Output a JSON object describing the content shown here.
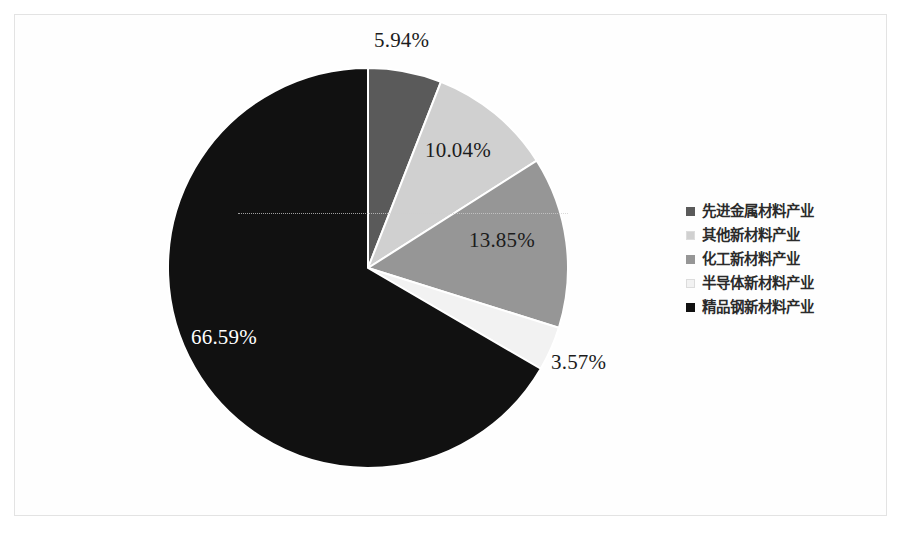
{
  "chart_data": {
    "type": "pie",
    "title": "",
    "subtitle": "",
    "xlabel": "",
    "ylabel": "",
    "grid": false,
    "legend_position": "right",
    "start_angle_deg": 0,
    "direction": "clockwise",
    "categories": [
      "先进金属材料产业",
      "其他新材料产业",
      "化工新材料产业",
      "半导体新材料产业",
      "精品钢新材料产业"
    ],
    "values": [
      5.94,
      10.04,
      13.85,
      3.57,
      66.59
    ],
    "value_labels": [
      "5.94%",
      "10.04%",
      "13.85%",
      "3.57%",
      "66.59%"
    ],
    "slice_colors": [
      "#5a5a5a",
      "#d0d0d0",
      "#969696",
      "#f2f2f2",
      "#111111"
    ],
    "label_text_colors": [
      "#1c1c1c",
      "#1c1c1c",
      "#1c1c1c",
      "#1c1c1c",
      "#ffffff"
    ],
    "units": "percent",
    "total": 99.99
  },
  "figure": {
    "border_color": "#e3e3e3",
    "background": "#ffffff"
  },
  "labels": {
    "slice_0": "5.94%",
    "slice_1": "10.04%",
    "slice_2": "13.85%",
    "slice_3": "3.57%",
    "slice_4": "66.59%"
  },
  "legend": {
    "items": [
      {
        "label": "先进金属材料产业",
        "color": "#5a5a5a"
      },
      {
        "label": "其他新材料产业",
        "color": "#d0d0d0"
      },
      {
        "label": "化工新材料产业",
        "color": "#969696"
      },
      {
        "label": "半导体新材料产业",
        "color": "#f2f2f2"
      },
      {
        "label": "精品钢新材料产业",
        "color": "#111111"
      }
    ]
  }
}
